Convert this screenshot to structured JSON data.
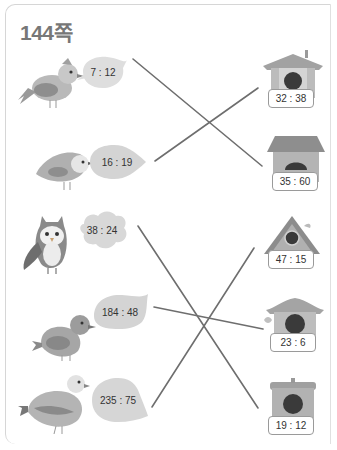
{
  "page": {
    "title": "144쪽"
  },
  "birds": [
    {
      "id": "bird-1",
      "ratio": "7 : 12",
      "kind": "songbird"
    },
    {
      "id": "bird-2",
      "ratio": "16 : 19",
      "kind": "dove"
    },
    {
      "id": "bird-3",
      "ratio": "38 : 24",
      "kind": "owl"
    },
    {
      "id": "bird-4",
      "ratio": "184 : 48",
      "kind": "sparrow"
    },
    {
      "id": "bird-5",
      "ratio": "235 : 75",
      "kind": "pigeon"
    }
  ],
  "houses": [
    {
      "id": "house-1",
      "ratio": "32 : 38"
    },
    {
      "id": "house-2",
      "ratio": "35 : 60"
    },
    {
      "id": "house-3",
      "ratio": "47 : 15"
    },
    {
      "id": "house-4",
      "ratio": "23 : 6"
    },
    {
      "id": "house-5",
      "ratio": "19 : 12"
    }
  ],
  "matches": [
    {
      "bird": "7 : 12",
      "house": "35 : 60"
    },
    {
      "bird": "16 : 19",
      "house": "32 : 38"
    },
    {
      "bird": "38 : 24",
      "house": "19 : 12"
    },
    {
      "bird": "184 : 48",
      "house": "23 : 6"
    },
    {
      "bird": "235 : 75",
      "house": "47 : 15"
    }
  ]
}
